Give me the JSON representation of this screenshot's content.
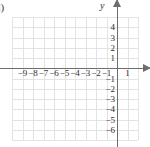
{
  "figure": {
    "item_label": "d)",
    "type": "cartesian-coordinate-grid",
    "colors": {
      "grid": "#e3e3e3",
      "axis": "#6d6d6d",
      "text": "#2e2e2e",
      "background": "#ffffff"
    }
  },
  "axes": {
    "x_axis_name": "x",
    "y_axis_name": "y",
    "x_arrow_icon": "arrow-right-icon",
    "y_arrow_icon": "arrow-up-icon"
  },
  "chart_data": {
    "type": "scatter",
    "title": "",
    "subtitle": "",
    "xlabel": "x",
    "ylabel": "y",
    "grid": true,
    "legend": false,
    "series": [],
    "x_tick_labels": [
      "−9",
      "−8",
      "−7",
      "−6",
      "−5",
      "−4",
      "−3",
      "−2",
      "−1",
      "1"
    ],
    "x_tick_values": [
      -9,
      -8,
      -7,
      -6,
      -5,
      -4,
      -3,
      -2,
      -1,
      1
    ],
    "y_tick_labels": [
      "4",
      "3",
      "2",
      "1",
      "−1",
      "−2",
      "−3",
      "−4",
      "−5",
      "−6"
    ],
    "y_tick_values": [
      4,
      3,
      2,
      1,
      -1,
      -2,
      -3,
      -4,
      -5,
      -6
    ],
    "xlim": [
      -10,
      2
    ],
    "ylim": [
      -7,
      5
    ],
    "x_gridlines": [
      -10,
      -9,
      -8,
      -7,
      -6,
      -5,
      -4,
      -3,
      -2,
      -1,
      0,
      1,
      2
    ],
    "y_gridlines": [
      5,
      4,
      3,
      2,
      1,
      0,
      -1,
      -2,
      -3,
      -4,
      -5,
      -6,
      -7
    ]
  }
}
